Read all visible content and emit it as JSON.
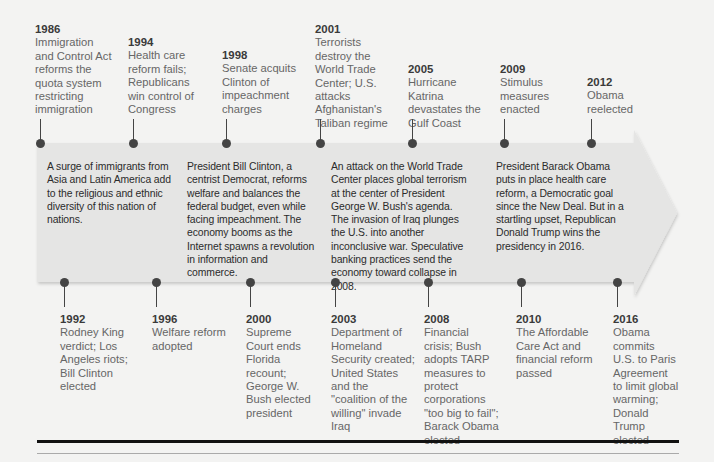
{
  "timeline": {
    "top_events": [
      {
        "year": "1986",
        "desc": "Immigration and Control Act reforms the quota system restricting immigration",
        "left": 35,
        "top": 23,
        "width": 78,
        "dot_x": 40,
        "stem_top": 120
      },
      {
        "year": "1994",
        "desc": "Health care reform fails; Republicans win control of Congress",
        "left": 128,
        "top": 36,
        "width": 78,
        "dot_x": 133,
        "stem_top": 120
      },
      {
        "year": "1998",
        "desc": "Senate acquits Clinton of impeachment charges",
        "left": 222,
        "top": 49,
        "width": 78,
        "dot_x": 226,
        "stem_top": 120
      },
      {
        "year": "2001",
        "desc": "Terrorists destroy the World Trade Center; U.S. attacks Afghanistan's Taliban regime",
        "left": 315,
        "top": 23,
        "width": 84,
        "dot_x": 320,
        "stem_top": 120
      },
      {
        "year": "2005",
        "desc": "Hurricane Katrina devastates the Gulf Coast",
        "left": 408,
        "top": 63,
        "width": 84,
        "dot_x": 412,
        "stem_top": 120
      },
      {
        "year": "2009",
        "desc": "Stimulus measures enacted",
        "left": 500,
        "top": 63,
        "width": 78,
        "dot_x": 504,
        "stem_top": 120
      },
      {
        "year": "2012",
        "desc": "Obama reelected",
        "left": 587,
        "top": 76,
        "width": 78,
        "dot_x": 591,
        "stem_top": 120
      }
    ],
    "eras": [
      {
        "text": "A surge of immigrants from Asia and Latin America add to the religious and ethnic diversity of this nation of nations.",
        "left": 47,
        "top": 160,
        "width": 130
      },
      {
        "text": "President Bill Clinton, a centrist Democrat, reforms welfare and balances the federal budget, even while facing impeachment. The economy booms as the Internet spawns a revolution in information and commerce.",
        "left": 187,
        "top": 160,
        "width": 128
      },
      {
        "text": "An attack on the World Trade Center places global terrorism at the center of President George W. Bush's agenda. The invasion of Iraq plunges the U.S. into another inconclusive war. Speculative banking practices send the economy toward collapse in 2008.",
        "left": 331,
        "top": 160,
        "width": 138
      },
      {
        "text": "President Barack Obama puts in place health care reform, a Democratic goal since the New Deal. But in a startling upset, Republican Donald Trump wins the presidency in 2016.",
        "left": 496,
        "top": 160,
        "width": 135
      }
    ],
    "bottom_events": [
      {
        "year": "1992",
        "desc": "Rodney King verdict; Los Angeles riots; Bill Clinton elected",
        "left": 60,
        "top": 313,
        "width": 80,
        "dot_x": 64
      },
      {
        "year": "1996",
        "desc": "Welfare reform adopted",
        "left": 152,
        "top": 313,
        "width": 80,
        "dot_x": 156
      },
      {
        "year": "2000",
        "desc": "Supreme Court ends Florida recount; George W. Bush elected president",
        "left": 246,
        "top": 313,
        "width": 74,
        "dot_x": 250
      },
      {
        "year": "2003",
        "desc": "Department of Homeland Security created; United States and the \"coalition of the willing\" invade Iraq",
        "left": 331,
        "top": 313,
        "width": 84,
        "dot_x": 335
      },
      {
        "year": "2008",
        "desc": "Financial crisis; Bush adopts TARP measures to protect corporations \"too big to fail\"; Barack Obama elected",
        "left": 424,
        "top": 313,
        "width": 76,
        "dot_x": 428
      },
      {
        "year": "2010",
        "desc": "The Affordable Care Act and financial reform passed",
        "left": 516,
        "top": 313,
        "width": 80,
        "dot_x": 521
      },
      {
        "year": "2016",
        "desc": "Obama commits U.S. to Paris Agreement to limit global warming; Donald Trump elected",
        "left": 613,
        "top": 313,
        "width": 66,
        "dot_x": 617
      }
    ]
  },
  "colors": {
    "background": "#f3f3f2",
    "arrow_fill": "#e4e4e3",
    "pin": "#444444",
    "rule": "#111111"
  }
}
